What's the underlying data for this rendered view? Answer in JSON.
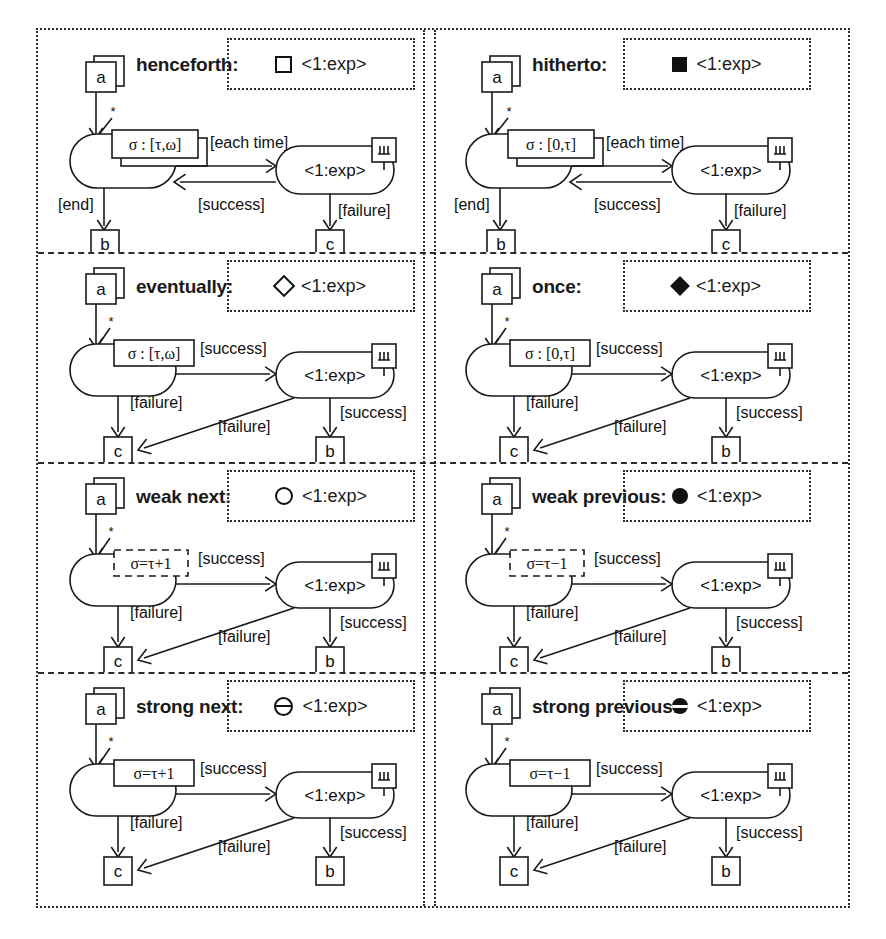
{
  "figure": {
    "panels": [
      {
        "id": "henceforth",
        "title": "henceforth:",
        "legend": {
          "glyph": "square-open-icon",
          "label": "<1:exp>"
        },
        "source_node": "a",
        "multiplicity": "*",
        "guard": "σ : [τ,ω]",
        "guard_style": "stacked",
        "loop_node": "<1:exp>",
        "rake_marker": "π",
        "end_label": "[end]",
        "end_node": "b",
        "forward_label": "[each time]",
        "back_label": "[success]",
        "failure_label": "[failure]",
        "failure_node": "c",
        "layout": "henceforth"
      },
      {
        "id": "hitherto",
        "title": "hitherto:",
        "legend": {
          "glyph": "square-filled-icon",
          "label": "<1:exp>"
        },
        "source_node": "a",
        "multiplicity": "*",
        "guard": "σ : [0,τ]",
        "guard_style": "stacked",
        "loop_node": "<1:exp>",
        "rake_marker": "π",
        "end_label": "[end]",
        "end_node": "b",
        "forward_label": "[each time]",
        "back_label": "[success]",
        "failure_label": "[failure]",
        "failure_node": "c",
        "layout": "henceforth"
      },
      {
        "id": "eventually",
        "title": "eventually:",
        "legend": {
          "glyph": "diamond-open-icon",
          "label": "<1:exp>"
        },
        "source_node": "a",
        "multiplicity": "*",
        "guard": "σ : [τ,ω]",
        "guard_style": "solid",
        "loop_node": "<1:exp>",
        "rake_marker": "π",
        "forward_label": "[success]",
        "left_fail_label": "[failure]",
        "left_fail_node": "c",
        "diag_fail_label": "[failure]",
        "right_label": "[success]",
        "right_node": "b",
        "layout": "eventually"
      },
      {
        "id": "once",
        "title": "once:",
        "legend": {
          "glyph": "diamond-filled-icon",
          "label": "<1:exp>"
        },
        "source_node": "a",
        "multiplicity": "*",
        "guard": "σ : [0,τ]",
        "guard_style": "solid",
        "loop_node": "<1:exp>",
        "rake_marker": "π",
        "forward_label": "[success]",
        "left_fail_label": "[failure]",
        "left_fail_node": "c",
        "diag_fail_label": "[failure]",
        "right_label": "[success]",
        "right_node": "b",
        "layout": "eventually"
      },
      {
        "id": "weak-next",
        "title": "weak next:",
        "legend": {
          "glyph": "circle-open-icon",
          "label": "<1:exp>"
        },
        "source_node": "a",
        "multiplicity": "*",
        "guard": "σ=τ+1",
        "guard_style": "dashed",
        "loop_node": "<1:exp>",
        "rake_marker": "π",
        "forward_label": "[success]",
        "left_fail_label": "[failure]",
        "left_fail_node": "c",
        "diag_fail_label": "[failure]",
        "right_label": "[success]",
        "right_node": "b",
        "layout": "eventually"
      },
      {
        "id": "weak-previous",
        "title": "weak previous:",
        "legend": {
          "glyph": "circle-filled-icon",
          "label": "<1:exp>"
        },
        "source_node": "a",
        "multiplicity": "*",
        "guard": "σ=τ−1",
        "guard_style": "dashed",
        "loop_node": "<1:exp>",
        "rake_marker": "π",
        "forward_label": "[success]",
        "left_fail_label": "[failure]",
        "left_fail_node": "c",
        "diag_fail_label": "[failure]",
        "right_label": "[success]",
        "right_node": "b",
        "layout": "eventually"
      },
      {
        "id": "strong-next",
        "title": "strong next:",
        "legend": {
          "glyph": "circle-open-bar-icon",
          "label": "<1:exp>"
        },
        "source_node": "a",
        "multiplicity": "*",
        "guard": "σ=τ+1",
        "guard_style": "solid",
        "loop_node": "<1:exp>",
        "rake_marker": "π",
        "forward_label": "[success]",
        "left_fail_label": "[failure]",
        "left_fail_node": "c",
        "diag_fail_label": "[failure]",
        "right_label": "[success]",
        "right_node": "b",
        "layout": "eventually"
      },
      {
        "id": "strong-previous",
        "title": "strong previous:",
        "legend": {
          "glyph": "circle-filled-bar-icon",
          "label": "<1:exp>"
        },
        "source_node": "a",
        "multiplicity": "*",
        "guard": "σ=τ−1",
        "guard_style": "solid",
        "loop_node": "<1:exp>",
        "rake_marker": "π",
        "forward_label": "[success]",
        "left_fail_label": "[failure]",
        "left_fail_node": "c",
        "diag_fail_label": "[failure]",
        "right_label": "[success]",
        "right_node": "b",
        "layout": "eventually"
      }
    ]
  },
  "colors": {
    "ink": "#1a1a1a",
    "paper": "#ffffff"
  }
}
